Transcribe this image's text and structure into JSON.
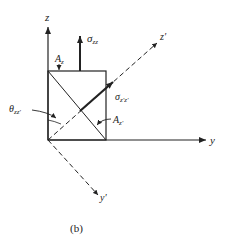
{
  "figure": {
    "caption": "(b)",
    "axes": {
      "z": "z",
      "y": "y",
      "z_prime": "z′",
      "y_prime": "y′"
    },
    "labels": {
      "sigma_zz_main": "σ",
      "sigma_zz_sub": "zz",
      "sigma_zpzp_main": "σ",
      "sigma_zpzp_sub": "z′z′",
      "A_z_main": "A",
      "A_z_sub": "z",
      "A_zp_main": "A",
      "A_zp_sub": "z′",
      "theta_main": "θ",
      "theta_sub": "zz′"
    },
    "colors": {
      "line": "#222222",
      "background": "#ffffff"
    }
  }
}
